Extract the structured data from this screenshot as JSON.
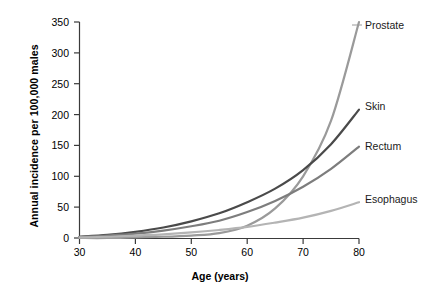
{
  "chart_data": {
    "type": "line",
    "title": "",
    "xlabel": "Age (years)",
    "ylabel": "Annual incidence per 100,000 males",
    "xlim": [
      30,
      80
    ],
    "ylim": [
      0,
      350
    ],
    "xticks": [
      30,
      40,
      50,
      60,
      70,
      80
    ],
    "yticks": [
      0,
      50,
      100,
      150,
      200,
      250,
      300,
      350
    ],
    "grid": false,
    "legend_position": "right-inline-labels",
    "x": [
      30,
      35,
      40,
      45,
      50,
      55,
      60,
      65,
      70,
      75,
      80
    ],
    "series": [
      {
        "name": "Prostate",
        "color": "#9a9a9a",
        "values": [
          0,
          0,
          1,
          2,
          4,
          8,
          20,
          48,
          100,
          190,
          350
        ]
      },
      {
        "name": "Skin",
        "color": "#4a4a4a",
        "values": [
          2,
          5,
          10,
          17,
          27,
          40,
          58,
          80,
          110,
          152,
          208
        ]
      },
      {
        "name": "Rectum",
        "color": "#7d7d7d",
        "values": [
          2,
          4,
          7,
          12,
          19,
          28,
          42,
          60,
          83,
          112,
          148
        ]
      },
      {
        "name": "Esophagus",
        "color": "#b4b4b4",
        "values": [
          1,
          2,
          4,
          6,
          9,
          13,
          18,
          25,
          33,
          44,
          58
        ]
      }
    ]
  },
  "labels": {
    "prostate": "Prostate",
    "skin": "Skin",
    "rectum": "Rectum",
    "esophagus": "Esophagus"
  },
  "ytick_text": {
    "t0": "0",
    "t1": "50",
    "t2": "100",
    "t3": "150",
    "t4": "200",
    "t5": "250",
    "t6": "300",
    "t7": "350"
  },
  "xtick_text": {
    "t0": "30",
    "t1": "40",
    "t2": "50",
    "t3": "60",
    "t4": "70",
    "t5": "80"
  },
  "axes": {
    "x_title": "Age (years)",
    "y_title": "Annual incidence per 100,000 males"
  }
}
